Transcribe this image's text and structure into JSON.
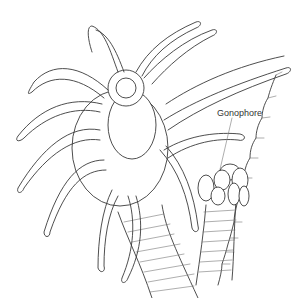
{
  "figure": {
    "labels": [
      {
        "id": "gonophore",
        "text": "Gonophore",
        "x": 239,
        "y": 114
      }
    ]
  }
}
